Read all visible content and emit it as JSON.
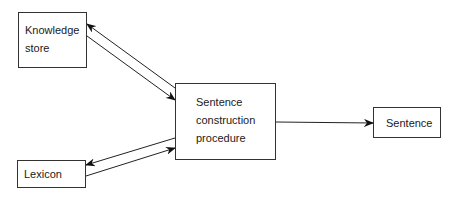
{
  "diagram": {
    "nodes": {
      "knowledge_store": {
        "line1": "Knowledge",
        "line2": "store"
      },
      "sentence_construction": {
        "line1": "Sentence",
        "line2": "construction",
        "line3": "procedure"
      },
      "lexicon": {
        "label": "Lexicon"
      },
      "sentence": {
        "label": "Sentence"
      }
    },
    "edges": [
      {
        "from": "Sentence construction procedure",
        "to": "Knowledge store"
      },
      {
        "from": "Knowledge store",
        "to": "Sentence construction procedure"
      },
      {
        "from": "Sentence construction procedure",
        "to": "Lexicon"
      },
      {
        "from": "Lexicon",
        "to": "Sentence construction procedure"
      },
      {
        "from": "Sentence construction procedure",
        "to": "Sentence"
      }
    ]
  }
}
